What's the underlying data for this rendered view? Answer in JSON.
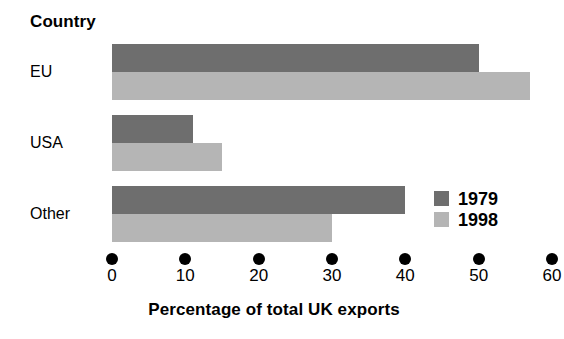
{
  "chart_data": {
    "type": "bar",
    "orientation": "horizontal",
    "title": "",
    "xlabel": "Percentage of total UK exports",
    "ylabel": "Country",
    "categories": [
      "EU",
      "USA",
      "Other"
    ],
    "series": [
      {
        "name": "1979",
        "color": "#6e6e6e",
        "values": [
          50,
          11,
          40
        ]
      },
      {
        "name": "1998",
        "color": "#b5b5b5",
        "values": [
          57,
          15,
          30
        ]
      }
    ],
    "xlim": [
      0,
      60
    ],
    "xticks": [
      0,
      10,
      20,
      30,
      40,
      50,
      60
    ],
    "xtick_labels": [
      "0",
      "10",
      "20",
      "30",
      "40",
      "50",
      "60"
    ],
    "grid": false,
    "legend_position": "inside-right",
    "tick_marker": "filled-circle"
  },
  "legend": {
    "entries": [
      {
        "label": "1979",
        "color": "#6e6e6e"
      },
      {
        "label": "1998",
        "color": "#b5b5b5"
      }
    ]
  }
}
